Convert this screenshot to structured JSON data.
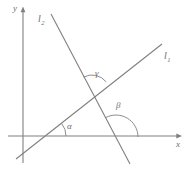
{
  "figure": {
    "kind": "geometry-diagram",
    "background_color": "#ffffff",
    "stroke_color": "#808080",
    "label_color": "#6e6e6e"
  },
  "axes": {
    "x_axis": {
      "label": "x",
      "label_position": {
        "x": 177,
        "y": 141
      },
      "start": {
        "x": 8,
        "y": 136
      },
      "end": {
        "x": 181,
        "y": 136
      },
      "arrow": "right"
    },
    "y_axis": {
      "label": "y",
      "label_position": {
        "x": 13,
        "y": 5
      },
      "start": {
        "x": 23,
        "y": 163
      },
      "end": {
        "x": 23,
        "y": 8
      },
      "arrow": "up"
    }
  },
  "lines": [
    {
      "name": "l1",
      "label": "l",
      "subscript": "1",
      "label_position": {
        "x": 164,
        "y": 52
      },
      "from": {
        "x": 16,
        "y": 159
      },
      "to": {
        "x": 162,
        "y": 44
      },
      "x_intercept": {
        "x": 46,
        "y": 136
      },
      "slope_sign": "positive"
    },
    {
      "name": "l2",
      "label": "l",
      "subscript": "2",
      "label_position": {
        "x": 38,
        "y": 15
      },
      "from": {
        "x": 51,
        "y": 14
      },
      "to": {
        "x": 130,
        "y": 164
      },
      "x_intercept": {
        "x": 116,
        "y": 137
      },
      "slope_sign": "negative"
    }
  ],
  "intersection": {
    "x": 92,
    "y": 93
  },
  "angles": [
    {
      "name": "alpha",
      "label": "α",
      "label_position": {
        "x": 67,
        "y": 122
      },
      "vertex": {
        "x": 46,
        "y": 136
      },
      "radius": 20,
      "between": [
        "x-axis",
        "l1"
      ],
      "start_deg": 0,
      "end_deg": 38
    },
    {
      "name": "beta",
      "label": "β",
      "label_position": {
        "x": 116,
        "y": 101
      },
      "vertex": {
        "x": 116,
        "y": 137
      },
      "radius": 22,
      "between": [
        "x-axis",
        "l2"
      ],
      "start_deg": 0,
      "end_deg": 118
    },
    {
      "name": "gamma",
      "label": "γ",
      "label_position": {
        "x": 95,
        "y": 69
      },
      "vertex": {
        "x": 92,
        "y": 93
      },
      "radius": 18,
      "between": [
        "l1",
        "l2"
      ],
      "start_deg": 38,
      "end_deg": 118
    }
  ]
}
